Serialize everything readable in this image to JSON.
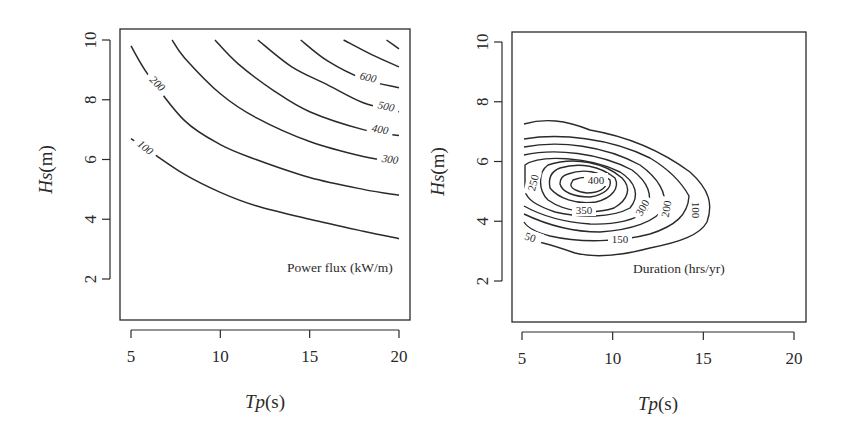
{
  "chart_data": [
    {
      "type": "contour",
      "title": "Power flux (kW/m)",
      "xlabel": "Tp(s)",
      "ylabel": "Hs(m)",
      "xlim": [
        4.5,
        20.5
      ],
      "ylim": [
        0.6,
        10.4
      ],
      "xticks": [
        5,
        10,
        15,
        20
      ],
      "yticks": [
        2,
        4,
        6,
        8,
        10
      ],
      "grid": false,
      "contour_levels": [
        100,
        200,
        300,
        400,
        500,
        600,
        700
      ],
      "contours": [
        {
          "level": 100,
          "label": "100",
          "points": [
            [
              5,
              6.7
            ],
            [
              6,
              6.3
            ],
            [
              8,
              5.5
            ],
            [
              10,
              4.9
            ],
            [
              12,
              4.45
            ],
            [
              15,
              4.0
            ],
            [
              18,
              3.6
            ],
            [
              20,
              3.35
            ]
          ]
        },
        {
          "level": 200,
          "label": "200",
          "points": [
            [
              5,
              9.8
            ],
            [
              6,
              8.8
            ],
            [
              8,
              7.3
            ],
            [
              10,
              6.5
            ],
            [
              12,
              6.0
            ],
            [
              15,
              5.4
            ],
            [
              18,
              5.0
            ],
            [
              20,
              4.8
            ]
          ]
        },
        {
          "level": 300,
          "label": "300",
          "points": [
            [
              7.3,
              10
            ],
            [
              8,
              9.4
            ],
            [
              10,
              8.2
            ],
            [
              12,
              7.4
            ],
            [
              15,
              6.6
            ],
            [
              18,
              6.1
            ],
            [
              20,
              5.9
            ]
          ]
        },
        {
          "level": 400,
          "label": "400",
          "points": [
            [
              9.7,
              10
            ],
            [
              11,
              9.2
            ],
            [
              13,
              8.3
            ],
            [
              15,
              7.6
            ],
            [
              18,
              7.0
            ],
            [
              20,
              6.8
            ]
          ]
        },
        {
          "level": 500,
          "label": "500",
          "points": [
            [
              12.1,
              10
            ],
            [
              14,
              9.1
            ],
            [
              16,
              8.5
            ],
            [
              18,
              7.9
            ],
            [
              20,
              7.6
            ]
          ]
        },
        {
          "level": 600,
          "label": "600",
          "points": [
            [
              14.5,
              10
            ],
            [
              16,
              9.3
            ],
            [
              18,
              8.7
            ],
            [
              20,
              8.4
            ]
          ]
        },
        {
          "level": 700,
          "label": "",
          "points": [
            [
              16.9,
              10
            ],
            [
              18.5,
              9.5
            ],
            [
              20,
              9.1
            ]
          ]
        },
        {
          "level": 800,
          "label": "",
          "points": [
            [
              19.3,
              10
            ],
            [
              20,
              9.7
            ]
          ]
        }
      ]
    },
    {
      "type": "contour",
      "title": "Duration (hrs/yr)",
      "xlabel": "Tp(s)",
      "ylabel": "Hs(m)",
      "xlim": [
        4.5,
        20.5
      ],
      "ylim": [
        0.6,
        10.4
      ],
      "xticks": [
        5,
        10,
        15,
        20
      ],
      "yticks": [
        2,
        4,
        6,
        8,
        10
      ],
      "grid": false,
      "contour_levels": [
        50,
        100,
        150,
        200,
        250,
        300,
        350,
        400,
        450
      ],
      "peak": {
        "Tp": 9,
        "Hs": 5.0
      },
      "contour_labels": [
        "50",
        "100",
        "150",
        "200",
        "250",
        "300",
        "350",
        "400"
      ]
    }
  ],
  "left_panel": {
    "title": "Power flux (kW/m)",
    "xlabel_italic": "Tp",
    "xlabel_unit": "(s)",
    "ylabel_italic": "Hs",
    "ylabel_unit": "(m)",
    "xticks": [
      "5",
      "10",
      "15",
      "20"
    ],
    "yticks": [
      "2",
      "4",
      "6",
      "8",
      "10"
    ]
  },
  "right_panel": {
    "title": "Duration (hrs/yr)",
    "xlabel_italic": "Tp",
    "xlabel_unit": "(s)",
    "ylabel_italic": "Hs",
    "ylabel_unit": "(m)",
    "xticks": [
      "5",
      "10",
      "15",
      "20"
    ],
    "yticks": [
      "2",
      "4",
      "6",
      "8",
      "10"
    ]
  },
  "colors": {
    "line": "#2a2a2a",
    "background": "#ffffff"
  }
}
